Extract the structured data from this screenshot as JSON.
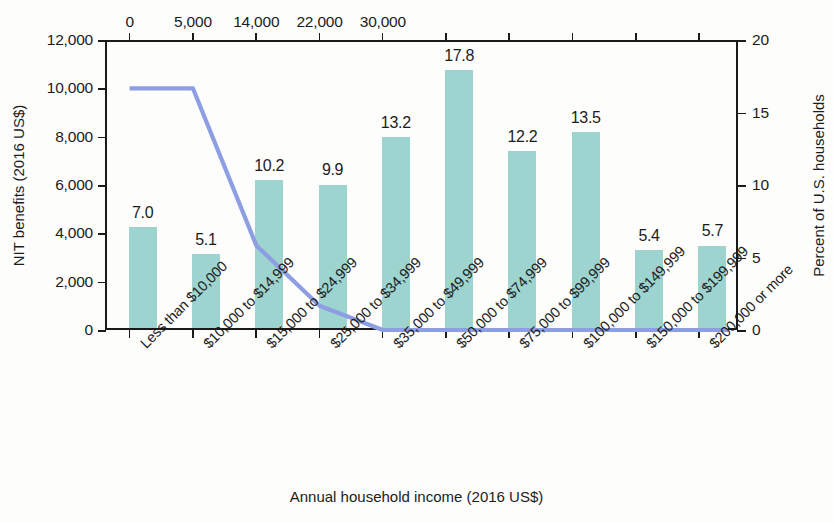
{
  "chart_data": {
    "type": "bar",
    "title": "",
    "xlabel": "Annual household income (2016 US$)",
    "ylabel": "NIT benefits (2016 US$)",
    "y2label": "Percent of U.S. households",
    "grid": false,
    "legend": "none",
    "categories": [
      "Less than $10,000",
      "$10,000 to $14,999",
      "$15,000 to $24,999",
      "$25,000 to $34,999",
      "$35,000 to $49,999",
      "$50,000 to $74,999",
      "$75,000 to $99,999",
      "$100,000 to $149,999",
      "$150,000 to $199,999",
      "$200,000 or more"
    ],
    "series": [
      {
        "name": "Percent of U.S. households",
        "type": "bar",
        "axis": "right",
        "values": [
          7.0,
          5.1,
          10.2,
          9.9,
          13.2,
          17.8,
          12.2,
          13.5,
          5.4,
          5.7
        ],
        "labels": [
          "7.0",
          "5.1",
          "10.2",
          "9.9",
          "13.2",
          "17.8",
          "12.2",
          "13.5",
          "5.4",
          "5.7"
        ],
        "color": "#9ed4cf"
      },
      {
        "name": "NIT benefits",
        "type": "line",
        "axis": "left",
        "color": "#8d9ee2",
        "x_income": [
          0,
          5000,
          14000,
          22000,
          30000
        ],
        "y_benefit": [
          10000,
          10000,
          3500,
          1000,
          0
        ]
      }
    ],
    "ylim": [
      0,
      12000
    ],
    "yticks": [
      0,
      2000,
      4000,
      6000,
      8000,
      10000,
      12000
    ],
    "ytick_labels": [
      "0",
      "2,000",
      "4,000",
      "6,000",
      "8,000",
      "10,000",
      "12,000"
    ],
    "y2lim": [
      0,
      20
    ],
    "y2ticks": [
      0,
      5,
      10,
      15,
      20
    ],
    "y2tick_labels": [
      "0",
      "5",
      "10",
      "15",
      "20"
    ],
    "top_axis_label": "Annual household income (2016 US$)",
    "top_tick_labels": [
      "0",
      "5,000",
      "14,000",
      "22,000",
      "30,000"
    ]
  },
  "colors": {
    "bar": "#9ed4cf",
    "line": "#8d9ee2",
    "axis": "#1a1a1a",
    "text": "#1c1c1c",
    "background": "#fdfdfc"
  }
}
